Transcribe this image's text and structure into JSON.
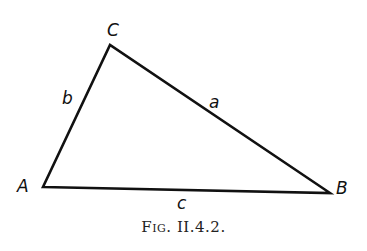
{
  "figure": {
    "vertices": {
      "A": {
        "label": "A",
        "x": 43,
        "y": 187
      },
      "B": {
        "label": "B",
        "x": 330,
        "y": 193
      },
      "C": {
        "label": "C",
        "x": 110,
        "y": 45
      }
    },
    "sides": {
      "a": {
        "label": "a",
        "from": "C",
        "to": "B"
      },
      "b": {
        "label": "b",
        "from": "A",
        "to": "C"
      },
      "c": {
        "label": "c",
        "from": "A",
        "to": "B"
      }
    },
    "caption": "Fig. II.4.2."
  }
}
